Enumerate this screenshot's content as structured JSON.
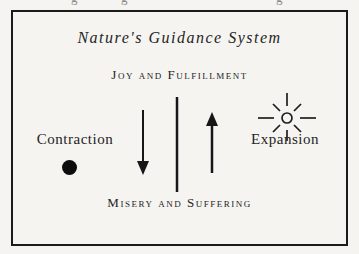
{
  "canvas": {
    "background": "#f5f4f1",
    "ink": "#242424",
    "frame_border": "#1b1b1b"
  },
  "cropped_top_line": {
    "fragments": [
      "g",
      "g",
      "g"
    ]
  },
  "diagram": {
    "title": "Nature's Guidance System",
    "top_label": "Joy and Fulfillment",
    "bottom_label": "Misery and Suffering",
    "left_label": "Contraction",
    "right_label": "Expansion",
    "icons": {
      "left": "filled-circle-icon",
      "right": "sun-icon",
      "center": [
        "down-arrow-icon",
        "vertical-divider-line",
        "up-arrow-icon"
      ]
    }
  }
}
